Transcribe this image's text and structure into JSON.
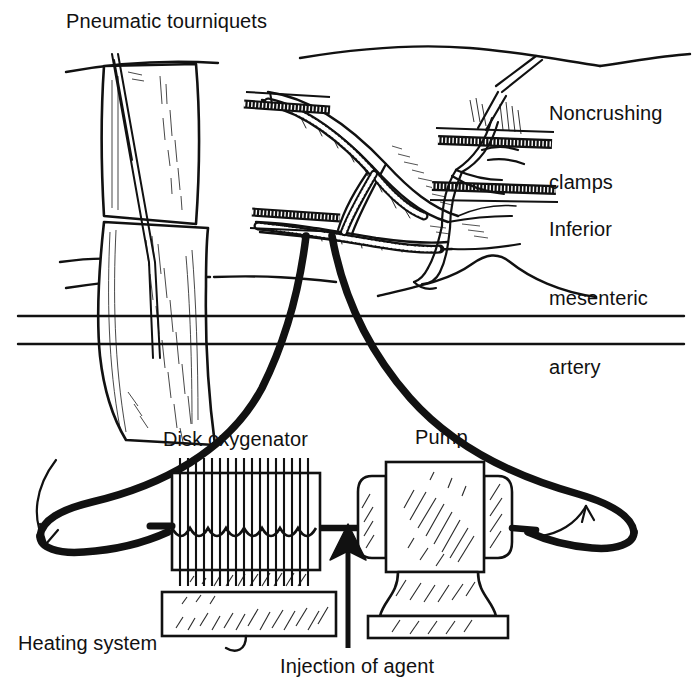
{
  "figure": {
    "style": "black-and-white line drawing",
    "background_color": "#ffffff",
    "ink_color": "#111111"
  },
  "labels": {
    "pneumatic_tourniquets": "Pneumatic tourniquets",
    "noncrushing_clamps_line1": "Noncrushing",
    "noncrushing_clamps_line2": "clamps",
    "inferior_mesenteric_line1": "Inferior",
    "inferior_mesenteric_line2": "mesenteric",
    "inferior_mesenteric_line3": "artery",
    "disk_oxygenator": "Disk oxygenator",
    "pump": "Pump",
    "heating_system": "Heating system",
    "injection_of_agent": "Injection of agent"
  },
  "components": [
    {
      "name": "pneumatic-tourniquet-upper",
      "type": "cuff"
    },
    {
      "name": "pneumatic-tourniquet-lower",
      "type": "cuff"
    },
    {
      "name": "noncrushing-clamp-upper",
      "type": "clamp"
    },
    {
      "name": "noncrushing-clamp-lower",
      "type": "clamp"
    },
    {
      "name": "inferior-mesenteric-artery",
      "type": "vessel"
    },
    {
      "name": "disk-oxygenator",
      "type": "device"
    },
    {
      "name": "heating-system",
      "type": "device"
    },
    {
      "name": "pump",
      "type": "device"
    },
    {
      "name": "arterial-tube",
      "type": "tubing"
    },
    {
      "name": "venous-tube",
      "type": "tubing"
    },
    {
      "name": "flow-arrow-left",
      "type": "arrow",
      "direction": "down"
    },
    {
      "name": "flow-arrow-right",
      "type": "arrow",
      "direction": "up"
    },
    {
      "name": "injection-arrow",
      "type": "arrow",
      "direction": "up"
    }
  ]
}
